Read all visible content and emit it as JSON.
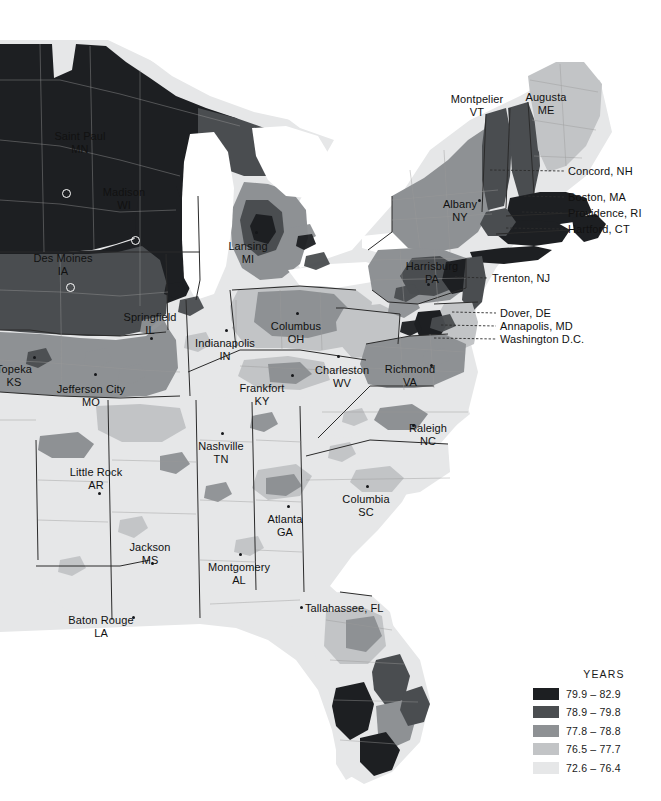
{
  "map": {
    "title": "US life expectancy by county — eastern half",
    "background_color": "#ffffff",
    "water_color": "#ffffff",
    "state_border_color": "#2b2b2b",
    "county_border_color": "#9a9a9a",
    "leader_line_color": "#2b2b2b"
  },
  "legend": {
    "title": "YEARS",
    "classes": [
      {
        "label": "79.9 – 82.9",
        "color": "#1d1f22",
        "min": 79.9,
        "max": 82.9
      },
      {
        "label": "78.9 – 79.8",
        "color": "#4a4d50",
        "min": 78.9,
        "max": 79.8
      },
      {
        "label": "77.8 – 78.8",
        "color": "#8e9194",
        "min": 77.8,
        "max": 78.8
      },
      {
        "label": "76.5 – 77.7",
        "color": "#c2c4c6",
        "min": 76.5,
        "max": 77.7
      },
      {
        "label": "72.6 – 76.4",
        "color": "#e6e7e8",
        "min": 72.6,
        "max": 76.4
      }
    ]
  },
  "chart_data": {
    "type": "map",
    "title": "YEARS",
    "legend_position": "bottom-right",
    "scale_kind": "choropleth-quantile",
    "classes": [
      {
        "label": "79.9 – 82.9",
        "color": "#1d1f22"
      },
      {
        "label": "78.9 – 79.8",
        "color": "#4a4d50"
      },
      {
        "label": "77.8 – 78.8",
        "color": "#8e9194"
      },
      {
        "label": "76.5 – 77.7",
        "color": "#c2c4c6"
      },
      {
        "label": "72.6 – 76.4",
        "color": "#e6e7e8"
      }
    ]
  },
  "city_labels": [
    {
      "name": "Saint Paul",
      "state": "MN",
      "x": 80,
      "y": 130,
      "align": "ctr",
      "dot": null,
      "capital_marker": [
        62,
        189
      ]
    },
    {
      "name": "Madison",
      "state": "WI",
      "x": 124,
      "y": 186,
      "align": "ctr",
      "dot": null,
      "capital_marker": [
        131,
        236
      ]
    },
    {
      "name": "Des Moines",
      "state": "IA",
      "x": 63,
      "y": 252,
      "align": "ctr",
      "dot": null,
      "capital_marker": [
        66,
        283
      ]
    },
    {
      "name": "Lansing",
      "state": "MI",
      "x": 248,
      "y": 240,
      "align": "ctr",
      "dot": [
        255,
        231
      ],
      "capital_marker": null
    },
    {
      "name": "Topeka",
      "state": "KS",
      "x": 14,
      "y": 363,
      "align": "ctr",
      "dot": [
        33,
        356
      ],
      "capital_marker": null
    },
    {
      "name": "Jefferson City",
      "state": "MO",
      "x": 91,
      "y": 383,
      "align": "ctr",
      "dot": [
        94,
        373
      ],
      "capital_marker": null
    },
    {
      "name": "Springfield",
      "state": "IL",
      "x": 150,
      "y": 311,
      "align": "ctr",
      "dot": [
        150,
        337
      ],
      "capital_marker": null
    },
    {
      "name": "Indianapolis",
      "state": "IN",
      "x": 225,
      "y": 337,
      "align": "ctr",
      "dot": [
        225,
        329
      ],
      "capital_marker": null
    },
    {
      "name": "Columbus",
      "state": "OH",
      "x": 296,
      "y": 320,
      "align": "ctr",
      "dot": [
        296,
        312
      ],
      "capital_marker": null
    },
    {
      "name": "Charleston",
      "state": "WV",
      "x": 342,
      "y": 364,
      "align": "ctr",
      "dot": [
        337,
        355
      ],
      "capital_marker": null
    },
    {
      "name": "Frankfort",
      "state": "KY",
      "x": 262,
      "y": 382,
      "align": "ctr",
      "dot": [
        291,
        374
      ],
      "capital_marker": null
    },
    {
      "name": "Richmond",
      "state": "VA",
      "x": 410,
      "y": 363,
      "align": "ctr",
      "dot": [
        430,
        364
      ],
      "capital_marker": null
    },
    {
      "name": "Raleigh",
      "state": "NC",
      "x": 428,
      "y": 422,
      "align": "ctr",
      "dot": [
        412,
        424
      ],
      "capital_marker": null
    },
    {
      "name": "Nashville",
      "state": "TN",
      "x": 221,
      "y": 440,
      "align": "ctr",
      "dot": [
        221,
        432
      ],
      "capital_marker": null
    },
    {
      "name": "Little Rock",
      "state": "AR",
      "x": 96,
      "y": 466,
      "align": "ctr",
      "dot": [
        98,
        492
      ],
      "capital_marker": null
    },
    {
      "name": "Columbia",
      "state": "SC",
      "x": 366,
      "y": 493,
      "align": "ctr",
      "dot": [
        366,
        485
      ],
      "capital_marker": null
    },
    {
      "name": "Atlanta",
      "state": "GA",
      "x": 285,
      "y": 513,
      "align": "ctr",
      "dot": [
        287,
        505
      ],
      "capital_marker": null
    },
    {
      "name": "Jackson",
      "state": "MS",
      "x": 150,
      "y": 541,
      "align": "ctr",
      "dot": [
        151,
        562
      ],
      "capital_marker": null
    },
    {
      "name": "Montgomery",
      "state": "AL",
      "x": 239,
      "y": 561,
      "align": "ctr",
      "dot": [
        239,
        553
      ],
      "capital_marker": null
    },
    {
      "name": "Baton Rouge",
      "state": "LA",
      "x": 101,
      "y": 614,
      "align": "ctr",
      "dot": [
        132,
        616
      ],
      "capital_marker": null
    },
    {
      "name": "Montpelier",
      "state": "VT",
      "x": 477,
      "y": 93,
      "align": "ctr",
      "dot": null,
      "capital_marker": null
    },
    {
      "name": "Augusta",
      "state": "ME",
      "x": 546,
      "y": 91,
      "align": "ctr",
      "dot": null,
      "capital_marker": null
    },
    {
      "name": "Albany",
      "state": "NY",
      "x": 460,
      "y": 198,
      "align": "ctr",
      "dot": [
        478,
        199
      ],
      "capital_marker": null
    },
    {
      "name": "Harrisburg",
      "state": "PA",
      "x": 432,
      "y": 260,
      "align": "ctr",
      "dot": [
        427,
        283
      ],
      "capital_marker": null
    }
  ],
  "inline_labels": [
    {
      "text": "Tallahassee, FL",
      "x": 305,
      "y": 602,
      "dot": [
        300,
        606
      ]
    }
  ],
  "leader_labels": [
    {
      "text": "Concord, NH",
      "x": 568,
      "y": 165,
      "anchor_x": 490,
      "anchor_y": 170
    },
    {
      "text": "Boston, MA",
      "x": 568,
      "y": 191,
      "anchor_x": 524,
      "anchor_y": 196
    },
    {
      "text": "Providence, RI",
      "x": 568,
      "y": 207,
      "anchor_x": 522,
      "anchor_y": 212
    },
    {
      "text": "Hartford, CT",
      "x": 568,
      "y": 223,
      "anchor_x": 506,
      "anchor_y": 228
    },
    {
      "text": "Trenton, NJ",
      "x": 492,
      "y": 272,
      "anchor_x": 455,
      "anchor_y": 277
    },
    {
      "text": "Dover, DE",
      "x": 500,
      "y": 307,
      "anchor_x": 452,
      "anchor_y": 312
    },
    {
      "text": "Annapolis, MD",
      "x": 500,
      "y": 320,
      "anchor_x": 441,
      "anchor_y": 325
    },
    {
      "text": "Washington D.C.",
      "x": 500,
      "y": 333,
      "anchor_x": 434,
      "anchor_y": 338
    }
  ]
}
